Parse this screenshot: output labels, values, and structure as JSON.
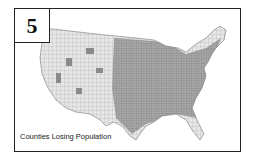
{
  "panel": {
    "number": "5",
    "caption": "Counties Losing Population"
  },
  "map": {
    "subject": "United States county map",
    "colors": {
      "land_light": "#e6e6e6",
      "county_dark": "#8a8a8a",
      "border": "#222222"
    }
  }
}
